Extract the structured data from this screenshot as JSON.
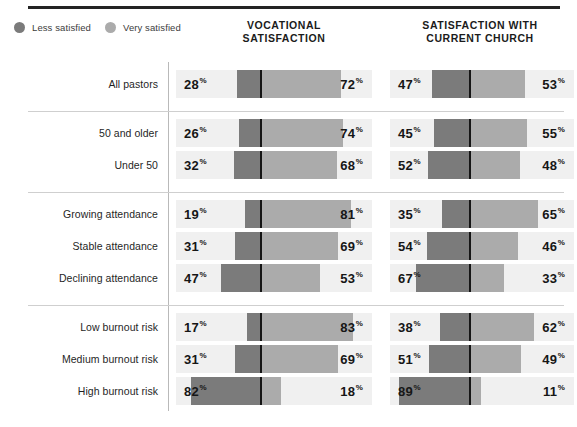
{
  "legend": {
    "items": [
      {
        "label": "Less satisfied",
        "color": "#7b7b7b",
        "icon": "legend-dot-icon"
      },
      {
        "label": "Very satisfied",
        "color": "#ababab",
        "icon": "legend-dot-icon"
      }
    ]
  },
  "columns": [
    {
      "id": "vocational",
      "line1": "VOCATIONAL",
      "line2": "SATISFACTION"
    },
    {
      "id": "current-church",
      "line1": "SATISFACTION WITH",
      "line2": "CURRENT CHURCH"
    }
  ],
  "percent_symbol": "%",
  "chart_data": {
    "type": "bar",
    "subtype": "diverging-stacked-bar",
    "xlabel": "",
    "ylabel": "",
    "xlim": [
      0,
      100
    ],
    "grid": false,
    "legend_position": "top-left",
    "legend": [
      "Less satisfied",
      "Very satisfied"
    ],
    "colors": {
      "less_satisfied": "#7b7b7b",
      "very_satisfied": "#ababab",
      "track": "#f0f0f0",
      "divider": "#151515",
      "text": "#161616"
    },
    "panels": [
      {
        "id": "vocational",
        "name": "VOCATIONAL SATISFACTION"
      },
      {
        "id": "current-church",
        "name": "SATISFACTION WITH CURRENT CHURCH"
      }
    ],
    "groups": [
      {
        "id": "all",
        "rows": [
          {
            "category": "All pastors",
            "vocational": {
              "less_satisfied": 28,
              "very_satisfied": 72
            },
            "current_church": {
              "less_satisfied": 47,
              "very_satisfied": 53
            }
          }
        ]
      },
      {
        "id": "age",
        "rows": [
          {
            "category": "50 and older",
            "vocational": {
              "less_satisfied": 26,
              "very_satisfied": 74
            },
            "current_church": {
              "less_satisfied": 45,
              "very_satisfied": 55
            }
          },
          {
            "category": "Under 50",
            "vocational": {
              "less_satisfied": 32,
              "very_satisfied": 68
            },
            "current_church": {
              "less_satisfied": 52,
              "very_satisfied": 48
            }
          }
        ]
      },
      {
        "id": "attendance",
        "rows": [
          {
            "category": "Growing attendance",
            "vocational": {
              "less_satisfied": 19,
              "very_satisfied": 81
            },
            "current_church": {
              "less_satisfied": 35,
              "very_satisfied": 65
            }
          },
          {
            "category": "Stable attendance",
            "vocational": {
              "less_satisfied": 31,
              "very_satisfied": 69
            },
            "current_church": {
              "less_satisfied": 54,
              "very_satisfied": 46
            }
          },
          {
            "category": "Declining attendance",
            "vocational": {
              "less_satisfied": 47,
              "very_satisfied": 53
            },
            "current_church": {
              "less_satisfied": 67,
              "very_satisfied": 33
            }
          }
        ]
      },
      {
        "id": "burnout",
        "rows": [
          {
            "category": "Low burnout risk",
            "vocational": {
              "less_satisfied": 17,
              "very_satisfied": 83
            },
            "current_church": {
              "less_satisfied": 38,
              "very_satisfied": 62
            }
          },
          {
            "category": "Medium burnout risk",
            "vocational": {
              "less_satisfied": 31,
              "very_satisfied": 69
            },
            "current_church": {
              "less_satisfied": 51,
              "very_satisfied": 49
            }
          },
          {
            "category": "High burnout risk",
            "vocational": {
              "less_satisfied": 82,
              "very_satisfied": 18
            },
            "current_church": {
              "less_satisfied": 89,
              "very_satisfied": 11
            }
          }
        ]
      }
    ]
  }
}
